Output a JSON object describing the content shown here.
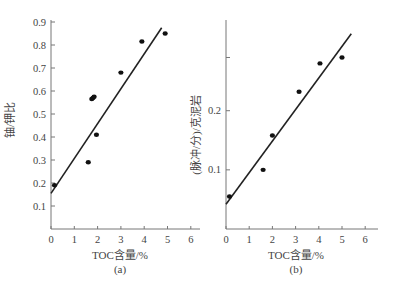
{
  "chart_data": [
    {
      "type": "scatter",
      "panel_label": "(a)",
      "title": "",
      "xlabel": "TOC含量/%",
      "ylabel": "铀/钾比",
      "xlim": [
        0,
        6.4
      ],
      "ylim": [
        0,
        0.9
      ],
      "xticks": [
        "0",
        "1",
        "2",
        "3",
        "4",
        "5",
        "6"
      ],
      "yticks": [
        "0.1",
        "0.2",
        "0.3",
        "0.4",
        "0.5",
        "0.6",
        "0.7",
        "0.8",
        "0.9"
      ],
      "grid": false,
      "legend": null,
      "points": [
        {
          "x": 0.15,
          "y": 0.19
        },
        {
          "x": 1.6,
          "y": 0.29
        },
        {
          "x": 1.75,
          "y": 0.565
        },
        {
          "x": 1.8,
          "y": 0.57
        },
        {
          "x": 1.85,
          "y": 0.575
        },
        {
          "x": 1.95,
          "y": 0.41
        },
        {
          "x": 3.0,
          "y": 0.68
        },
        {
          "x": 3.9,
          "y": 0.815
        },
        {
          "x": 4.9,
          "y": 0.85
        }
      ],
      "fit_line": {
        "x0": 0.0,
        "y0": 0.155,
        "x1": 4.75,
        "y1": 0.875
      }
    },
    {
      "type": "scatter",
      "panel_label": "(b)",
      "title": "",
      "xlabel": "TOC含量/%",
      "ylabel": "(脉冲/分)/克泥岩",
      "xlim": [
        0,
        6.4
      ],
      "ylim": [
        0,
        0.35
      ],
      "xticks": [
        "0",
        "1",
        "2",
        "3",
        "4",
        "5",
        "6"
      ],
      "yticks": [
        "0.1",
        "0.2"
      ],
      "extra_unlabeled_ytick": 0.29,
      "grid": false,
      "legend": null,
      "points": [
        {
          "x": 0.15,
          "y": 0.055
        },
        {
          "x": 1.6,
          "y": 0.1
        },
        {
          "x": 2.0,
          "y": 0.158
        },
        {
          "x": 3.15,
          "y": 0.232
        },
        {
          "x": 4.05,
          "y": 0.28
        },
        {
          "x": 5.0,
          "y": 0.29
        }
      ],
      "fit_line": {
        "x0": 0.0,
        "y0": 0.042,
        "x1": 5.4,
        "y1": 0.33
      }
    }
  ]
}
